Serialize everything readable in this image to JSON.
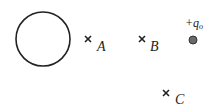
{
  "diagram": {
    "colors": {
      "stroke": "#222222",
      "charge_fill": "#6a6a6a",
      "charge_stroke": "#333333",
      "background": "#ffffff"
    },
    "sphere": {
      "cx": 43,
      "cy": 39,
      "r": 27
    },
    "points": [
      {
        "id": "A",
        "label": "A",
        "x": 88,
        "y": 39
      },
      {
        "id": "B",
        "label": "B",
        "x": 142,
        "y": 39
      },
      {
        "id": "C",
        "label": "C",
        "x": 166,
        "y": 93
      }
    ],
    "test_charge": {
      "sign": "+",
      "symbol": "q",
      "subscript": "o",
      "x": 193,
      "y": 40,
      "r": 4
    }
  }
}
